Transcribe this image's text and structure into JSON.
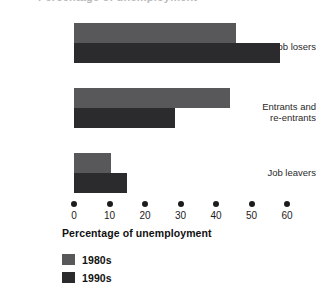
{
  "figure": {
    "cropped_top_text": "Percentage of unemployment",
    "background_color": "#ffffff"
  },
  "axis": {
    "title": "Percentage of unemployment",
    "tick_labels": [
      "0",
      "10",
      "20",
      "30",
      "40",
      "50",
      "60"
    ]
  },
  "legend": {
    "entries": [
      {
        "label": "1980s",
        "color": "#58585a"
      },
      {
        "label": "1990s",
        "color": "#2b2b2d"
      }
    ]
  },
  "categories": [
    {
      "label": "Job losers"
    },
    {
      "label": "Entrants and\nre-entrants"
    },
    {
      "label": "Job leavers"
    }
  ],
  "chart_data": {
    "type": "bar",
    "orientation": "horizontal",
    "title": "Percentage of unemployment",
    "xlabel": "Percentage of unemployment",
    "ylabel": "",
    "xlim": [
      0,
      60
    ],
    "xticks": [
      0,
      10,
      20,
      30,
      40,
      50,
      60
    ],
    "grid": false,
    "legend_position": "below-axis-left",
    "categories": [
      "Job losers",
      "Entrants and re-entrants",
      "Job leavers"
    ],
    "series": [
      {
        "name": "1980s",
        "color": "#58585a",
        "values": [
          45.5,
          44,
          10.5
        ]
      },
      {
        "name": "1990s",
        "color": "#2b2b2d",
        "values": [
          58,
          28.5,
          15
        ]
      }
    ]
  }
}
